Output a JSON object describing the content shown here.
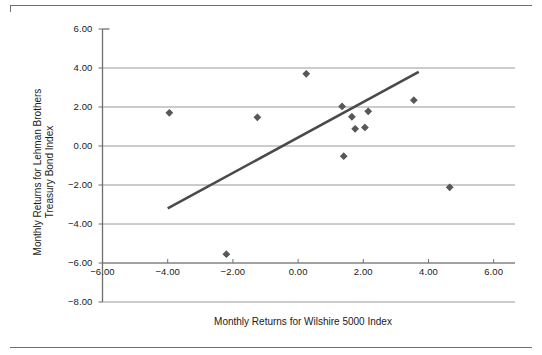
{
  "figure": {
    "top_rule": "horizontal-rule",
    "bottom_rule": "horizontal-rule"
  },
  "chart_data": {
    "type": "scatter",
    "title": "",
    "xlabel": "Monthly Returns for Wilshire 5000 Index",
    "ylabel": "Monthly Returns for Lehman Brothers Treasury Bond Index",
    "ylabel_lines": [
      "Monthly Returns for Lehman Brothers",
      "Treasury Bond Index"
    ],
    "xlim": [
      -6.0,
      6.0
    ],
    "ylim": [
      -8.0,
      6.0
    ],
    "xticks": [
      -6.0,
      -4.0,
      -2.0,
      0.0,
      2.0,
      4.0,
      6.0
    ],
    "yticks": [
      6.0,
      4.0,
      2.0,
      0.0,
      -2.0,
      -4.0,
      -6.0,
      -8.0
    ],
    "xtick_labels": [
      "-6.00",
      "-4.00",
      "-2.00",
      "0.00",
      "2.00",
      "4.00",
      "6.00"
    ],
    "ytick_labels": [
      "6.00",
      "4.00",
      "2.00",
      "0.00",
      "-2.00",
      "-4.00",
      "-6.00",
      "-8.00"
    ],
    "grid": "horizontal-only",
    "grid_color": "#8c8c8c",
    "axis_color": "#6f6f6f",
    "marker": "diamond",
    "marker_color": "#575757",
    "marker_size": 5,
    "legend": "none",
    "points": [
      {
        "x": -3.95,
        "y": 1.7
      },
      {
        "x": -2.2,
        "y": -5.55
      },
      {
        "x": -1.25,
        "y": 1.47
      },
      {
        "x": 0.25,
        "y": 3.7
      },
      {
        "x": 1.35,
        "y": 2.03
      },
      {
        "x": 1.4,
        "y": -0.52
      },
      {
        "x": 1.65,
        "y": 1.5
      },
      {
        "x": 1.75,
        "y": 0.88
      },
      {
        "x": 2.05,
        "y": 0.95
      },
      {
        "x": 2.15,
        "y": 1.78
      },
      {
        "x": 3.55,
        "y": 2.35
      },
      {
        "x": 4.65,
        "y": -2.12
      }
    ],
    "trendline": {
      "type": "linear-fit",
      "color": "#4a4a4a",
      "width": 2.6,
      "x0": -4.0,
      "y0": -3.2,
      "x1": 3.7,
      "y1": 3.8
    }
  }
}
